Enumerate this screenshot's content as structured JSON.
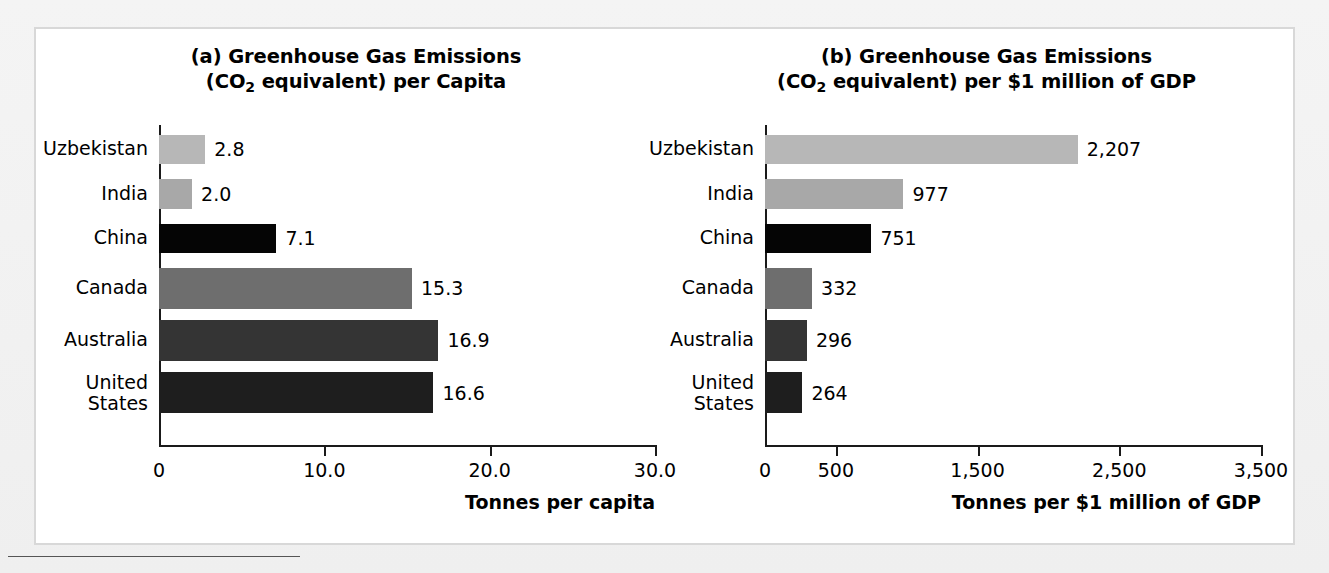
{
  "figure": {
    "background_color": "#ffffff",
    "page_color": "#f2f2f2"
  },
  "chart_data": [
    {
      "type": "bar",
      "orientation": "horizontal",
      "panel": "(a)",
      "title_line1": "(a) Greenhouse Gas Emissions",
      "title_line2_pre": "(CO",
      "title_line2_sub": "2",
      "title_line2_post": " equivalent) per Capita",
      "title_plain": "(a) Greenhouse Gas Emissions (CO2 equivalent) per Capita",
      "categories": [
        "Uzbekistan",
        "India",
        "China",
        "Canada",
        "Australia",
        "United\nStates"
      ],
      "values": [
        2.8,
        2.0,
        7.1,
        15.3,
        16.9,
        16.6
      ],
      "value_labels": [
        "2.8",
        "2.0",
        "7.1",
        "15.3",
        "16.9",
        "16.6"
      ],
      "bar_colors": [
        "#b7b7b7",
        "#a8a8a8",
        "#050505",
        "#6e6e6e",
        "#343434",
        "#1e1e1e"
      ],
      "xlabel": "Tonnes per capita",
      "ylabel": "",
      "xlim": [
        0,
        30
      ],
      "xticks": [
        0,
        10,
        20,
        30
      ],
      "xtick_labels": [
        "0",
        "10.0",
        "20.0",
        "30.0"
      ],
      "grid": false,
      "legend": false
    },
    {
      "type": "bar",
      "orientation": "horizontal",
      "panel": "(b)",
      "title_line1": "(b) Greenhouse Gas Emissions",
      "title_line2_pre": "(CO",
      "title_line2_sub": "2",
      "title_line2_post": " equivalent) per $1 million of GDP",
      "title_plain": "(b) Greenhouse Gas Emissions (CO2 equivalent) per $1 million of GDP",
      "categories": [
        "Uzbekistan",
        "India",
        "China",
        "Canada",
        "Australia",
        "United\nStates"
      ],
      "values": [
        2207,
        977,
        751,
        332,
        296,
        264
      ],
      "value_labels": [
        "2,207",
        "977",
        "751",
        "332",
        "296",
        "264"
      ],
      "bar_colors": [
        "#b7b7b7",
        "#a8a8a8",
        "#050505",
        "#6e6e6e",
        "#343434",
        "#1e1e1e"
      ],
      "xlabel": "Tonnes per $1 million of GDP",
      "ylabel": "",
      "xlim": [
        0,
        3500
      ],
      "xticks": [
        0,
        500,
        1500,
        2500,
        3500
      ],
      "xtick_labels": [
        "0",
        "500",
        "1,500",
        "2,500",
        "3,500"
      ],
      "grid": false,
      "legend": false
    }
  ]
}
